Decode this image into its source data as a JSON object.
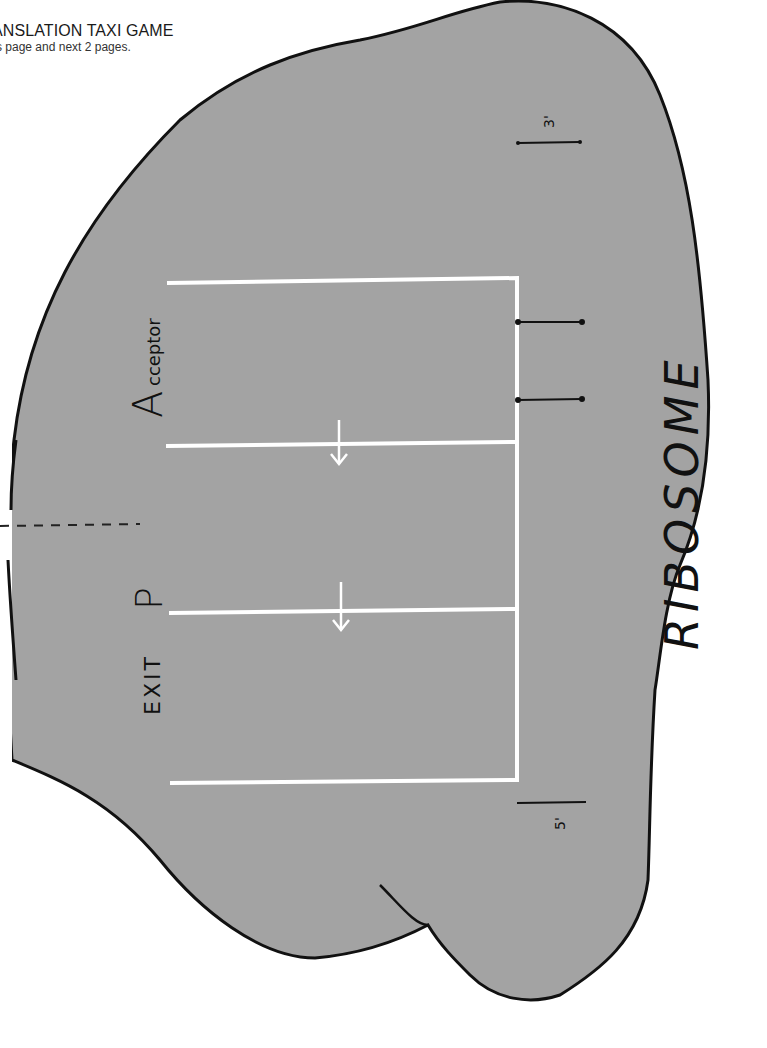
{
  "header": {
    "title": "ANSLATION TAXI GAME",
    "subtitle": "s page and next 2 pages."
  },
  "diagram": {
    "shape_label": "RIBOSOME",
    "sites": [
      {
        "label_big": "A",
        "label_small": "cceptor",
        "name": "acceptor-site"
      },
      {
        "label_big": "P",
        "label_small": "",
        "name": "p-site"
      },
      {
        "label_big": "EXIT",
        "label_small": "",
        "name": "exit-site"
      }
    ],
    "mrna_ends": {
      "three_prime": "3'",
      "five_prime": "5'"
    },
    "colors": {
      "ribosome_fill": "#a3a3a3",
      "outline": "#111111",
      "track_lines": "#ffffff",
      "background": "#ffffff"
    }
  }
}
